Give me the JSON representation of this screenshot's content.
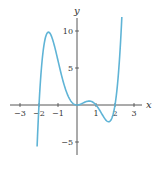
{
  "chart_data": {
    "type": "line",
    "title": "",
    "xlabel": "x",
    "ylabel": "y",
    "xlim": [
      -3.3,
      3.3
    ],
    "ylim": [
      -6.8,
      12.3
    ],
    "grid": false,
    "legend": null,
    "x_ticks": [
      -3,
      -2,
      -1,
      1,
      2,
      3
    ],
    "x_tick_labels": [
      "−3",
      "−2",
      "−1",
      "1",
      "2",
      "3"
    ],
    "y_ticks": [
      10,
      5,
      -5
    ],
    "y_tick_labels": [
      "10",
      "5",
      "−5"
    ],
    "series": [
      {
        "name": "f(x)",
        "color": "#5fb4d6",
        "domain": [
          -2.1,
          2.36
        ],
        "formula": "x^2 (x+2)(x-1)(x-2)",
        "x": [
          -2.1,
          -2.0,
          -1.8,
          -1.5,
          -1.2,
          -1.0,
          -0.5,
          0.0,
          0.3,
          0.6,
          1.0,
          1.4,
          1.7,
          2.0,
          2.2,
          2.36
        ],
        "y": [
          -5.6,
          0.0,
          7.3,
          9.8,
          8.0,
          6.0,
          1.6,
          0.0,
          0.31,
          0.52,
          0.0,
          -1.6,
          -2.25,
          0.0,
          5.4,
          11.6
        ]
      }
    ],
    "key_points": {
      "roots": [
        -2,
        0,
        1,
        2
      ],
      "local_max": [
        {
          "x": -1.5,
          "y": 9.8
        },
        {
          "x": 0.6,
          "y": 0.5
        }
      ],
      "local_min": [
        {
          "x": 0,
          "y": 0
        },
        {
          "x": 1.7,
          "y": -2.3
        }
      ]
    }
  }
}
